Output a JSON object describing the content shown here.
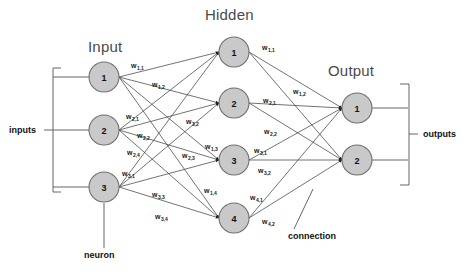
{
  "titles": {
    "input": "Input",
    "hidden": "Hidden",
    "output": "Output"
  },
  "annotations": {
    "inputs": "inputs",
    "outputs": "outputs",
    "neuron": "neuron",
    "connection": "connection"
  },
  "layers": {
    "input": {
      "name": "Input",
      "nodes": [
        {
          "label": "1",
          "cx": 104,
          "cy": 77,
          "r": 15
        },
        {
          "label": "2",
          "cx": 104,
          "cy": 130,
          "r": 15
        },
        {
          "label": "3",
          "cx": 104,
          "cy": 187,
          "r": 15
        }
      ]
    },
    "hidden": {
      "name": "Hidden",
      "nodes": [
        {
          "label": "1",
          "cx": 234,
          "cy": 52,
          "r": 15
        },
        {
          "label": "2",
          "cx": 234,
          "cy": 103,
          "r": 15
        },
        {
          "label": "3",
          "cx": 234,
          "cy": 160,
          "r": 15
        },
        {
          "label": "4",
          "cx": 234,
          "cy": 218,
          "r": 15
        }
      ]
    },
    "output": {
      "name": "Output",
      "nodes": [
        {
          "label": "1",
          "cx": 357,
          "cy": 108,
          "r": 15
        },
        {
          "label": "2",
          "cx": 357,
          "cy": 160,
          "r": 15
        }
      ]
    }
  },
  "weights_input_hidden": [
    {
      "text": "w",
      "sub": "1,1",
      "from": 0,
      "to": 0,
      "x": 131,
      "y": 62
    },
    {
      "text": "w",
      "sub": "1,2",
      "from": 0,
      "to": 1,
      "x": 152,
      "y": 81
    },
    {
      "text": "w",
      "sub": "1,3",
      "from": 0,
      "to": 2,
      "x": 205,
      "y": 143
    },
    {
      "text": "w",
      "sub": "1,4",
      "from": 0,
      "to": 3,
      "x": 204,
      "y": 187
    },
    {
      "text": "w",
      "sub": "2,1",
      "from": 1,
      "to": 0,
      "x": 126,
      "y": 113
    },
    {
      "text": "w",
      "sub": "2,2",
      "from": 1,
      "to": 1,
      "x": 137,
      "y": 132
    },
    {
      "text": "w",
      "sub": "2,3",
      "from": 1,
      "to": 2,
      "x": 182,
      "y": 152
    },
    {
      "text": "w",
      "sub": "2,4",
      "from": 1,
      "to": 3,
      "x": 127,
      "y": 149
    },
    {
      "text": "w",
      "sub": "3,1",
      "from": 2,
      "to": 0,
      "x": 122,
      "y": 170
    },
    {
      "text": "w",
      "sub": "3,2",
      "from": 2,
      "to": 1,
      "x": 122,
      "y": 152
    },
    {
      "text": "w",
      "sub": "3,3",
      "from": 2,
      "to": 2,
      "x": 152,
      "y": 191
    },
    {
      "text": "w",
      "sub": "3,4",
      "from": 2,
      "to": 3,
      "x": 155,
      "y": 213
    }
  ],
  "weights_hidden_output": [
    {
      "text": "w",
      "sub": "1,1",
      "from": 0,
      "to": 0,
      "x": 262,
      "y": 44
    },
    {
      "text": "w",
      "sub": "1,2",
      "from": 0,
      "to": 1,
      "x": 293,
      "y": 88
    },
    {
      "text": "w",
      "sub": "2,1",
      "from": 1,
      "to": 0,
      "x": 263,
      "y": 97
    },
    {
      "text": "w",
      "sub": "2,2",
      "from": 1,
      "to": 1,
      "x": 264,
      "y": 128
    },
    {
      "text": "w",
      "sub": "3,1",
      "from": 2,
      "to": 0,
      "x": 254,
      "y": 147
    },
    {
      "text": "w",
      "sub": "3,2",
      "from": 2,
      "to": 1,
      "x": 258,
      "y": 167
    },
    {
      "text": "w",
      "sub": "4,1",
      "from": 3,
      "to": 0,
      "x": 250,
      "y": 194
    },
    {
      "text": "w",
      "sub": "4,2",
      "from": 3,
      "to": 1,
      "x": 262,
      "y": 218
    }
  ],
  "colors": {
    "node_fill": "#c9c9c9",
    "node_stroke": "#6e6e6e",
    "edge": "#444444",
    "title_text": "#4a4a4a",
    "label_text": "#111111",
    "background": "#ffffff",
    "bracket": "#555555"
  }
}
